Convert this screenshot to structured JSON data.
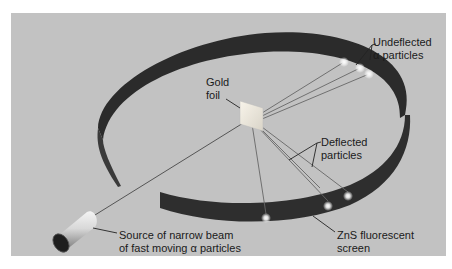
{
  "figure": {
    "labels": {
      "gold_foil": [
        "Gold",
        "foil"
      ],
      "undeflected": [
        "Undeflected",
        "α particles"
      ],
      "deflected": [
        "Deflected",
        "particles"
      ],
      "source": [
        "Source of narrow beam",
        "of fast moving α particles"
      ],
      "screen": [
        "ZnS fluorescent",
        "screen"
      ]
    },
    "colors": {
      "background": "#c2c2c2",
      "screen_band": "#2e2e2e",
      "beam_line": "#555555",
      "flash": "#ffffff"
    }
  }
}
